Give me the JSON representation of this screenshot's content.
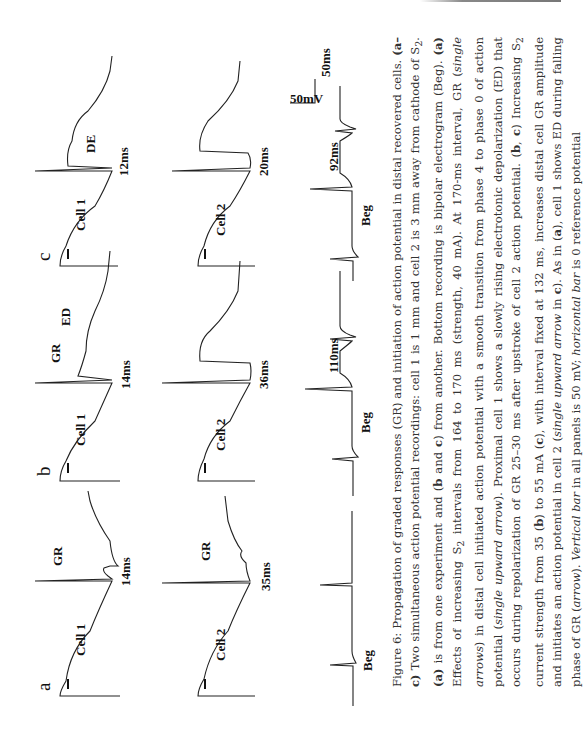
{
  "figure": {
    "panels": [
      {
        "id": "a",
        "label": "a",
        "cell1": {
          "label": "Cell 1",
          "annotation": "GR",
          "interval": "14ms"
        },
        "cell2": {
          "label": "Cell 2",
          "annotation": "GR",
          "interval": "35ms"
        },
        "beg": {
          "label": "Beg"
        }
      },
      {
        "id": "b",
        "label": "b",
        "cell1": {
          "label": "Cell 1",
          "annotation": "GR",
          "annotation2": "ED",
          "interval": "14ms"
        },
        "cell2": {
          "label": "Cell 2",
          "interval": "36ms"
        },
        "beg": {
          "label": "Beg",
          "interval": "110ms"
        }
      },
      {
        "id": "c",
        "label": "c",
        "cell1": {
          "label": "Cell 1",
          "annotation": "DE",
          "interval": "12ms"
        },
        "cell2": {
          "label": "Cell 2",
          "interval": "20ms"
        },
        "beg": {
          "label": "Beg",
          "interval": "92ms"
        }
      }
    ],
    "scale_bar": {
      "vertical": "50mV",
      "horizontal": "50ms"
    }
  },
  "caption": {
    "prefix": "Figure 6:",
    "text_1": " Propagation of graded responses (GR) and initiation of action potential in distal recovered cells. ",
    "b1": "(a–c)",
    "text_2": " Two simultaneous action potential recordings: cell 1 is 1 mm and cell 2 is 3 mm away from cathode of S",
    "sub_2": "2",
    "text_3": ". ",
    "b2": "(a)",
    "text_4": " is from one experiment and (",
    "b3": "b",
    "text_5": " and ",
    "b4": "c",
    "text_6": ") from another. Bottom recording is bipolar electrogram (Beg). ",
    "b5": "(a)",
    "text_7": " Effects of increasing S",
    "text_8": " intervals from 164 to 170 ms (strength, 40 mA). At 170-ms interval, GR (",
    "i1": "single arrows",
    "text_9": ") in distal cell initiated action potential with a smooth transition from phase 4 to phase 0 of action potential (",
    "i2": "single upward arrow",
    "text_10": "). Proximal cell 1 shows a slowly rising electrotonic depolarization (ED) that occurs during repolarization of GR 25–30 ms after upstroke of cell 2 action potential. (",
    "b6": "b",
    "text_11": ", ",
    "b7": "c",
    "text_12": ") Increasing S",
    "text_13": " current strength from 35 (",
    "b8": "b",
    "text_14": ") to 55 mA (",
    "b9": "c",
    "text_15": "), with interval fixed at 132 ms, increases distal cell GR amplitude and initiates an action potential in cell 2 (",
    "i3": "single upward arrow",
    "text_16": " in ",
    "b10": "c",
    "text_17": "). As in (",
    "b11": "a",
    "text_18": "), cell 1 shows ED during falling phase of GR (",
    "i4": "arrow",
    "text_19": "). ",
    "i5": "Vertical bar",
    "text_20": " in all panels is 50 mV; ",
    "i6": "horizontal bar",
    "text_21": " is 0 reference potential"
  }
}
